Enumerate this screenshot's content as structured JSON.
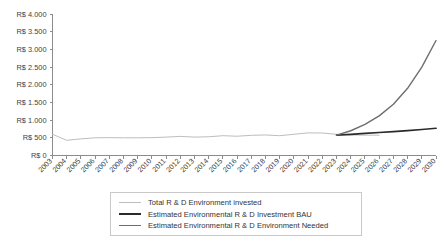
{
  "chart_data": {
    "type": "line",
    "title": "",
    "xlabel": "",
    "ylabel": "",
    "currency_prefix": "R$",
    "ylim": [
      0,
      4000
    ],
    "ytick_values": [
      0,
      500,
      1000,
      1500,
      2000,
      2500,
      3000,
      3500,
      4000
    ],
    "ytick_labels": [
      "R$ 0",
      "R$ 500",
      "R$ 1.000",
      "R$ 1.500",
      "R$ 2.000",
      "R$ 2.500",
      "R$ 3.000",
      "R$ 3.500",
      "R$ 4.000"
    ],
    "grid": false,
    "legend_position": "bottom-center",
    "categories": [
      "2003",
      "2004",
      "2005",
      "2006",
      "2007",
      "2008",
      "2009",
      "2010",
      "2011",
      "2012",
      "2013",
      "2014",
      "2015",
      "2016",
      "2017",
      "2018",
      "2019",
      "2020",
      "2021",
      "2022",
      "2023",
      "2024",
      "2025",
      "2026",
      "2027",
      "2028",
      "2029",
      "2030"
    ],
    "series": [
      {
        "name": "Total R & D Environment invested",
        "color": "#bdbdbd",
        "width": 1.0,
        "values": [
          600,
          430,
          470,
          500,
          505,
          500,
          500,
          505,
          520,
          540,
          520,
          530,
          560,
          545,
          570,
          580,
          560,
          600,
          640,
          635,
          600,
          580,
          575,
          575,
          null,
          null,
          null,
          null
        ]
      },
      {
        "name": "Estimated Environmental R & D Investment BAU",
        "color": "#2b2b2b",
        "width": 1.7,
        "values": [
          null,
          null,
          null,
          null,
          null,
          null,
          null,
          null,
          null,
          null,
          null,
          null,
          null,
          null,
          null,
          null,
          null,
          null,
          null,
          null,
          575,
          600,
          625,
          650,
          675,
          705,
          735,
          770
        ]
      },
      {
        "name": "Estimated Environmental R & D Environment Needed",
        "color": "#6e6e6e",
        "width": 1.4,
        "values": [
          null,
          null,
          null,
          null,
          null,
          null,
          null,
          null,
          null,
          null,
          null,
          null,
          null,
          null,
          null,
          null,
          null,
          null,
          null,
          null,
          575,
          700,
          880,
          1120,
          1450,
          1900,
          2500,
          3250
        ]
      }
    ],
    "annotations": []
  },
  "legend": {
    "entries": [
      {
        "label": "Total R & D Environment invested",
        "color": "#bdbdbd"
      },
      {
        "label": "Estimated Environmental R & D Investment BAU",
        "color": "#2b2b2b"
      },
      {
        "label": "Estimated Environmental R & D Environment Needed",
        "color": "#6e6e6e"
      }
    ]
  }
}
